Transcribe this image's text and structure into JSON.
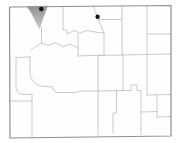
{
  "map": {
    "width": 178,
    "height": 143,
    "colors": {
      "background": "#ffffff",
      "land": "#fefefe",
      "state_border": "#8f8f8f",
      "county_line": "#bdbdbd",
      "marker": "#141414",
      "shade_top": "#8a8a8a",
      "shade_bottom": "#c9c9c9",
      "shade_edge": "#a8a8a8"
    },
    "state": {
      "outline_points": "9.5,7 171,5.5 171,136 10,138",
      "border_width": 1.2
    },
    "county_line_width": 0.8,
    "county_lines": [
      {
        "name": "park-east",
        "d": "M63,7 L63,30 L67,30 L67,34"
      },
      {
        "name": "bighorn-south",
        "d": "M67,34 L74,30.5 L80,33 L87,30.5 L95,32 L104,33"
      },
      {
        "name": "bighorn-east",
        "d": "M93,6 Q96,13 97.5,17.5 Q100.5,25.5 104,33"
      },
      {
        "name": "washakie-west",
        "d": "M78,34 L78,56"
      },
      {
        "name": "washakie-east",
        "d": "M104,33 L104,55"
      },
      {
        "name": "washakie-south",
        "d": "M78,56 L104,55"
      },
      {
        "name": "fremont-north",
        "d": "M78,48 L70,44 L63,47 L55,42.5 L48,45.5 L42,43 L36,46 L31,50"
      },
      {
        "name": "teton-east",
        "d": "M41.5,27.5 L41.5,43.5"
      },
      {
        "name": "teton-south",
        "d": "M16,57.5 L30,57"
      },
      {
        "name": "sheridan-south",
        "d": "M99,19.5 L122,19.5"
      },
      {
        "name": "campbell-west",
        "d": "M122,6 L122,55"
      },
      {
        "name": "campbell-south",
        "d": "M122,55 L171,54"
      },
      {
        "name": "crook-west",
        "d": "M147,6 L147,95"
      },
      {
        "name": "crook-south",
        "d": "M147,34 L171,34"
      },
      {
        "name": "natrona-north",
        "d": "M98,55.5 L123,55"
      },
      {
        "name": "natrona-east",
        "d": "M123,55 L123,90.5"
      },
      {
        "name": "natrona-west",
        "d": "M98,56 L98,135"
      },
      {
        "name": "niobrara-south",
        "d": "M147,95 L171,94.5"
      },
      {
        "name": "sublette-east",
        "d": "M30,57 L30,72 Q30,82 40,86 L52,87"
      },
      {
        "name": "lincoln-east",
        "d": "M16,57.5 L16,88 Q16,93.5 23,94.5 L32,94.5"
      },
      {
        "name": "sweetwater-north",
        "d": "M52,87 L55.5,92.5 L76,92.5 L80,91 L98,91"
      },
      {
        "name": "carbon-north",
        "d": "M98,91 L123,90.5"
      },
      {
        "name": "albany-north",
        "d": "M123,90.5 L131,90.5 L131,85 L137,85 L137,90.5 L141,90.5"
      },
      {
        "name": "carbon-east",
        "d": "M116.5,90.5 L116.5,113 L113,113 L113,133"
      },
      {
        "name": "albany-east",
        "d": "M141,90.5 L141,134"
      },
      {
        "name": "platte-south",
        "d": "M141,112 L157,111.5"
      },
      {
        "name": "goshen-west",
        "d": "M157,95 L157,117"
      },
      {
        "name": "goshen-south",
        "d": "M157,117 L171,116.5"
      },
      {
        "name": "uinta-east",
        "d": "M32,94.5 L32,137"
      },
      {
        "name": "uinta-north",
        "d": "M10.5,101 L32,101"
      }
    ],
    "shaded_region": {
      "name": "range-shaded-area",
      "d": "M27,6.5 L47.5,6 L45.5,12 L43,18 L41,24 L39.5,28.5 L37.5,25 L34,18 L30.5,11.5 Z",
      "opacity": 0.95
    },
    "markers": [
      {
        "name": "record-marker-northwest",
        "cx": 41.3,
        "cy": 9,
        "r": 2.3
      },
      {
        "name": "record-marker-north",
        "cx": 97.6,
        "cy": 16.8,
        "r": 2.2
      }
    ]
  }
}
